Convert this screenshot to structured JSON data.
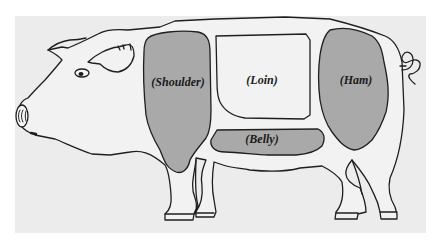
{
  "diagram": {
    "colors": {
      "page_background": "#ffffff",
      "panel_background": "#ececec",
      "outline": "#1f1f1f",
      "body_fill": "#f2f2f2",
      "cut_fill": "#a9a9a9"
    },
    "cuts": [
      {
        "id": "shoulder",
        "label": "(Shoulder)",
        "shaded": true
      },
      {
        "id": "loin",
        "label": "(Loin)",
        "shaded": false
      },
      {
        "id": "ham",
        "label": "(Ham)",
        "shaded": true
      },
      {
        "id": "belly",
        "label": "(Belly)",
        "shaded": true
      }
    ]
  }
}
